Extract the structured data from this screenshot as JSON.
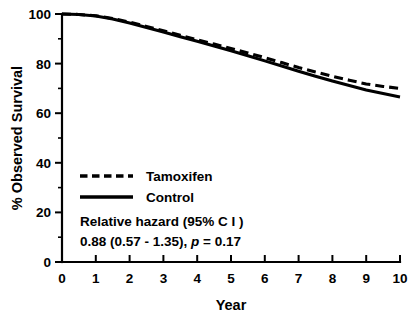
{
  "chart_data": {
    "type": "line",
    "title": "",
    "xlabel": "Year",
    "ylabel": "% Observed Survival",
    "xlim": [
      0,
      10
    ],
    "ylim": [
      0,
      100
    ],
    "xticks": [
      "0",
      "1",
      "2",
      "3",
      "4",
      "5",
      "6",
      "7",
      "8",
      "9",
      "10"
    ],
    "yticks": [
      "0",
      "20",
      "40",
      "60",
      "80",
      "100"
    ],
    "y_minor_ticks": [
      10,
      30,
      50,
      70,
      90
    ],
    "grid": false,
    "legend_position": "center-left",
    "x": [
      0,
      0.5,
      1,
      1.5,
      2,
      2.5,
      3,
      3.5,
      4,
      4.5,
      5,
      5.5,
      6,
      6.5,
      7,
      7.5,
      8,
      8.5,
      9,
      9.5,
      10
    ],
    "series": [
      {
        "name": "Tamoxifen",
        "style": "dashed",
        "color": "#000000",
        "values": [
          100.0,
          99.8,
          99.3,
          98.2,
          96.7,
          95.0,
          93.2,
          91.4,
          89.6,
          87.9,
          86.1,
          84.3,
          82.4,
          80.4,
          78.4,
          76.6,
          74.9,
          73.3,
          71.8,
          70.8,
          70.0
        ]
      },
      {
        "name": "Control",
        "style": "solid",
        "color": "#000000",
        "values": [
          100.0,
          99.8,
          99.2,
          98.0,
          96.4,
          94.6,
          92.7,
          90.8,
          89.0,
          87.1,
          85.2,
          83.2,
          81.1,
          79.0,
          76.9,
          74.9,
          73.0,
          71.2,
          69.4,
          67.9,
          66.5
        ]
      }
    ],
    "annotations": [
      "Relative hazard (95% C I )",
      "0.88 (0.57 - 1.35), p = 0.17"
    ],
    "annotation_detail": {
      "line1": "Relative hazard (95% C I )",
      "line2_prefix": "0.88 (0.57 - 1.35), ",
      "line2_italic": "p",
      "line2_suffix": " = 0.17"
    }
  },
  "legend": {
    "items": [
      {
        "label": "Tamoxifen",
        "style": "dashed"
      },
      {
        "label": "Control",
        "style": "solid"
      }
    ]
  }
}
